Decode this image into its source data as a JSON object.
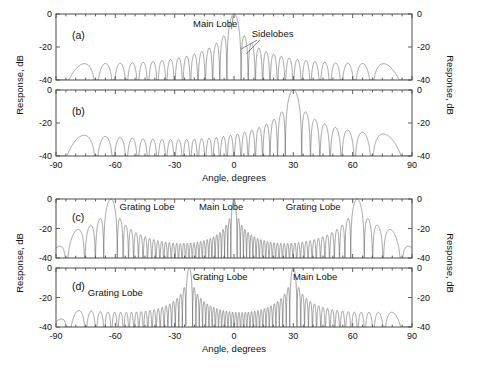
{
  "figure": {
    "width": 486,
    "height": 383,
    "background": "#ffffff",
    "line_color": "#5a5a5a",
    "axis_color": "#4d4d4d"
  },
  "axes": {
    "x_label": "Angle, degrees",
    "y_label": "Response, dB",
    "x_ticks": [
      -90,
      -60,
      -30,
      0,
      30,
      60,
      90
    ],
    "x_tick_labels": [
      "-90",
      "-60",
      "-30",
      "0",
      "30",
      "60",
      "90"
    ],
    "y_ticks": [
      0,
      -20,
      -40
    ],
    "y_tick_labels": [
      "0",
      "-20",
      "-40"
    ],
    "xlim": [
      -90,
      90
    ],
    "ylim": [
      -40,
      0
    ],
    "x_minor_step": 5
  },
  "groups": [
    {
      "name": "upper",
      "x_label": "Angle, degrees",
      "y_label_left": "Response, dB",
      "y_label_right": "Response, dB"
    },
    {
      "name": "lower",
      "x_label": "Angle, degrees",
      "y_label_left": "Response, dB",
      "y_label_right": "Response, dB"
    }
  ],
  "chart_data": {
    "type": "line",
    "title": "",
    "xlabel": "Angle, degrees",
    "ylabel": "Response, dB",
    "xlim": [
      -90,
      90
    ],
    "ylim": [
      -40,
      0
    ],
    "grid": false,
    "legend": "none",
    "xticks": [
      -90,
      -60,
      -30,
      0,
      30,
      60,
      90
    ],
    "yticks": [
      0,
      -20,
      -40
    ],
    "panels": [
      {
        "tag": "(a)",
        "description": "Uniform linear array beam pattern steered to broadside",
        "element_count": 32,
        "element_spacing_lambda": 0.5,
        "steer_angle_deg": 0,
        "peak_angle_deg": 0,
        "peak_value_db": 0,
        "floor_db": -40,
        "grating_lobes": [],
        "annotations": [
          {
            "text": "Main Lobe",
            "points_to_deg": 0,
            "points_to_db": 0
          },
          {
            "text": "Sidelobes",
            "points_to_deg": 7,
            "points_to_db": -13
          }
        ]
      },
      {
        "tag": "(b)",
        "description": "Uniform linear array beam pattern steered to 30 degrees",
        "element_count": 32,
        "element_spacing_lambda": 0.5,
        "steer_angle_deg": 30,
        "peak_angle_deg": 30,
        "peak_value_db": 0,
        "floor_db": -40,
        "grating_lobes": [],
        "annotations": []
      },
      {
        "tag": "(c)",
        "description": "Array with element spacing greater than half wavelength, broadside steer; grating lobes appear",
        "element_count": 32,
        "element_spacing_lambda": 1.13,
        "steer_angle_deg": 0,
        "peak_angle_deg": 0,
        "peak_value_db": 0,
        "floor_db": -40,
        "grating_lobes": [
          -62,
          62
        ],
        "annotations": [
          {
            "text": "Grating Lobe",
            "points_to_deg": -62,
            "points_to_db": 0
          },
          {
            "text": "Main Lobe",
            "points_to_deg": 0,
            "points_to_db": 0
          },
          {
            "text": "Grating Lobe",
            "points_to_deg": 62,
            "points_to_db": 0
          }
        ]
      },
      {
        "tag": "(d)",
        "description": "Array with element spacing greater than half wavelength steered to 30 degrees; grating lobes appear",
        "element_count": 32,
        "element_spacing_lambda": 1.13,
        "steer_angle_deg": 30,
        "peak_angle_deg": 30,
        "peak_value_db": 0,
        "floor_db": -40,
        "grating_lobes": [
          -22,
          -85
        ],
        "annotations": [
          {
            "text": "Grating Lobe",
            "points_to_deg": -22,
            "points_to_db": 0
          },
          {
            "text": "Main Lobe",
            "points_to_deg": 30,
            "points_to_db": 0
          },
          {
            "text": "Grating Lobe",
            "points_to_deg": -70,
            "points_to_db": -25
          }
        ]
      }
    ]
  },
  "labels": {
    "main_lobe": "Main Lobe",
    "sidelobes": "Sidelobes",
    "grating_lobe": "Grating Lobe",
    "tag_a": "(a)",
    "tag_b": "(b)",
    "tag_c": "(c)",
    "tag_d": "(d)"
  }
}
